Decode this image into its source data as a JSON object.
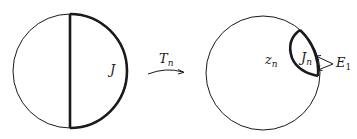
{
  "diagram": {
    "left_disk": {
      "arc_label": "J"
    },
    "map": {
      "label_main": "T",
      "label_sub": "n"
    },
    "right_disk": {
      "point_label_main": "z",
      "point_label_sub": "n",
      "arc_label_main": "J",
      "arc_label_sub": "n",
      "endpoint_label_main": "E",
      "endpoint_label_sub": "1"
    },
    "colors": {
      "stroke": "#1a1a1a",
      "background": "#ffffff"
    }
  }
}
